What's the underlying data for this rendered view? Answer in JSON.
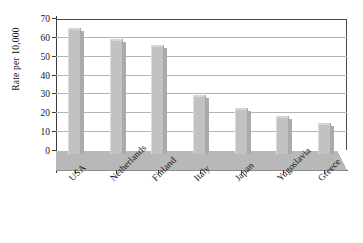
{
  "chart_data": {
    "type": "bar",
    "title": "",
    "subtitle": "",
    "xlabel": "",
    "ylabel": "Rate per 10,000",
    "categories": [
      "USA",
      "Netherlands",
      "Finland",
      "Italy",
      "Japan",
      "Yugoslavia",
      "Greece"
    ],
    "values": [
      65,
      59.5,
      56,
      29.5,
      23,
      18.5,
      15
    ],
    "ylim": [
      0,
      70
    ],
    "ytick_labels": [
      "0",
      "10",
      "20",
      "30",
      "40",
      "50",
      "60",
      "70"
    ],
    "ytick_values": [
      0,
      10,
      20,
      30,
      40,
      50,
      60,
      70
    ],
    "grid": true,
    "legend": false,
    "legend_position": "none",
    "style": "3d-bar",
    "bar_color": "#c2c2c2",
    "grid_color": "#b4b4b4",
    "axis_color": "#3a3a3a",
    "floor_color": "#b8b8b8"
  }
}
